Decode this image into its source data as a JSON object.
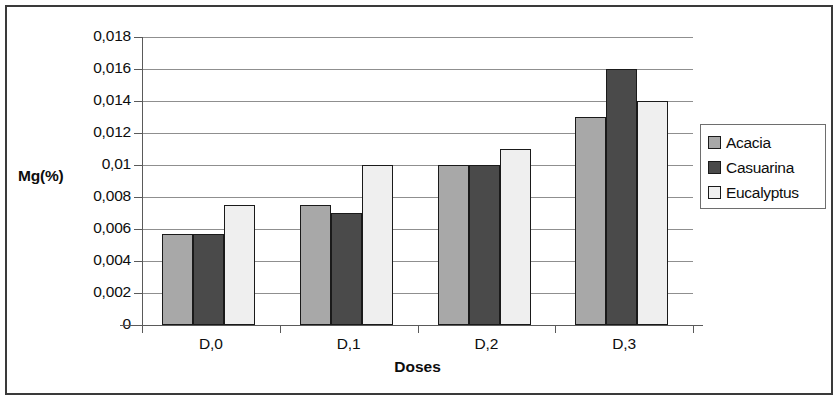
{
  "chart_data": {
    "type": "bar",
    "title": "",
    "xlabel": "Doses",
    "ylabel": "Mg(%)",
    "categories": [
      "D,0",
      "D,1",
      "D,2",
      "D,3"
    ],
    "series": [
      {
        "name": "Acacia",
        "color": "#a8a8a8",
        "values": [
          0.0057,
          0.0075,
          0.01,
          0.013
        ]
      },
      {
        "name": "Casuarina",
        "color": "#4a4a4a",
        "values": [
          0.0057,
          0.007,
          0.01,
          0.016
        ]
      },
      {
        "name": "Eucalyptus",
        "color": "#efefef",
        "values": [
          0.0075,
          0.01,
          0.011,
          0.014
        ]
      }
    ],
    "ylim": [
      0,
      0.018
    ],
    "ytick_labels": [
      "0,018",
      "0,016",
      "0,014",
      "0,012",
      "0,01",
      "0,008",
      "0,006",
      "0,004",
      "0,002",
      "0"
    ],
    "ytick_values": [
      0.018,
      0.016,
      0.014,
      0.012,
      0.01,
      0.008,
      0.006,
      0.004,
      0.002,
      0
    ],
    "grid": true,
    "legend_position": "right",
    "bar_border_color": "#1a1a1a"
  },
  "legend": {
    "entries": [
      {
        "label": "Acacia",
        "swatch_name": "legend-swatch-acacia"
      },
      {
        "label": "Casuarina",
        "swatch_name": "legend-swatch-casuarina"
      },
      {
        "label": "Eucalyptus",
        "swatch_name": "legend-swatch-eucalyptus"
      }
    ]
  }
}
